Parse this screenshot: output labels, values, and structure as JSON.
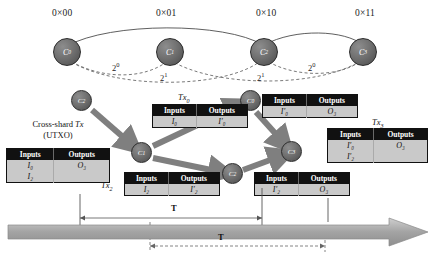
{
  "figure": {
    "shard_labels": [
      {
        "text": "0×00",
        "x": 52,
        "y": 8
      },
      {
        "text": "0×01",
        "x": 156,
        "y": 8
      },
      {
        "text": "0×10",
        "x": 256,
        "y": 8
      },
      {
        "text": "0×11",
        "x": 355,
        "y": 8
      }
    ],
    "top_nodes": [
      {
        "label": "C",
        "sub": "0",
        "cx": 67,
        "cy": 52
      },
      {
        "label": "C",
        "sub": "1",
        "cx": 170,
        "cy": 52
      },
      {
        "label": "C",
        "sub": "2",
        "cx": 264,
        "cy": 52
      },
      {
        "label": "C",
        "sub": "3",
        "cx": 363,
        "cy": 52
      }
    ],
    "edge_labels": [
      {
        "base": "2",
        "exp": "0",
        "x": 112,
        "y": 61
      },
      {
        "base": "2",
        "exp": "1",
        "x": 160,
        "y": 71
      },
      {
        "base": "2",
        "exp": "1",
        "x": 257,
        "y": 71
      },
      {
        "base": "2",
        "exp": "0",
        "x": 308,
        "y": 61
      }
    ],
    "flow_nodes": [
      {
        "label": "C",
        "sub": "2",
        "cx": 81,
        "cy": 100
      },
      {
        "label": "C",
        "sub": "0",
        "cx": 250,
        "cy": 100
      },
      {
        "label": "C",
        "sub": "1",
        "cx": 141,
        "cy": 152
      },
      {
        "label": "C",
        "sub": "3",
        "cx": 291,
        "cy": 151
      },
      {
        "label": "C",
        "sub": "2",
        "cx": 232,
        "cy": 173
      }
    ],
    "caption": {
      "line1_prefix": "Cross-shard ",
      "line1_italic": "Tx",
      "line2": "(UTXO)"
    },
    "tables": [
      {
        "name": "cross-shard-tx-table",
        "x": 6,
        "y": 148,
        "w": 104,
        "headers": [
          "Inputs",
          "Outputs"
        ],
        "rows": [
          [
            "I₀",
            "O₃"
          ],
          [
            "I₂",
            ""
          ]
        ]
      },
      {
        "name": "tx0-table",
        "x": 152,
        "y": 104,
        "w": 96,
        "headers": [
          "Inputs",
          "Outputs"
        ],
        "rows": [
          [
            "I₀",
            "I′₀"
          ]
        ]
      },
      {
        "name": "c0-table",
        "x": 262,
        "y": 94,
        "w": 96,
        "headers": [
          "Inputs",
          "Outputs"
        ],
        "rows": [
          [
            "I′₀",
            "O₃"
          ]
        ]
      },
      {
        "name": "tx3-table",
        "x": 327,
        "y": 128,
        "w": 101,
        "headers": [
          "Inputs",
          "Outputs"
        ],
        "rows": [
          [
            "I′₀",
            "O₃"
          ],
          [
            "I′₂",
            ""
          ]
        ]
      },
      {
        "name": "tx2-table",
        "x": 124,
        "y": 172,
        "w": 96,
        "headers": [
          "Inputs",
          "Outputs"
        ],
        "rows": [
          [
            "I₂",
            "I′₂"
          ]
        ]
      },
      {
        "name": "c3-table",
        "x": 254,
        "y": 172,
        "w": 96,
        "headers": [
          "Inputs",
          "Outputs"
        ],
        "rows": [
          [
            "I′₂",
            "O₃"
          ]
        ]
      }
    ],
    "tx_labels": [
      {
        "base": "Tx",
        "sub": "0",
        "x": 178,
        "y": 92
      },
      {
        "base": "Tx",
        "sub": "3",
        "x": 372,
        "y": 117
      },
      {
        "base": "Tx",
        "sub": "2",
        "x": 101,
        "y": 180
      }
    ],
    "period_marks": [
      {
        "text": "T",
        "x": 171,
        "y": 209
      },
      {
        "text": "T",
        "x": 218,
        "y": 238
      }
    ],
    "colors": {
      "header_bg": "#111111",
      "cell_bg": "#c9c9c9",
      "node_fill": "#6f6f6f",
      "arrow_gray": "#7a7a7a",
      "timeline_gray": "#a8a8a8"
    }
  }
}
